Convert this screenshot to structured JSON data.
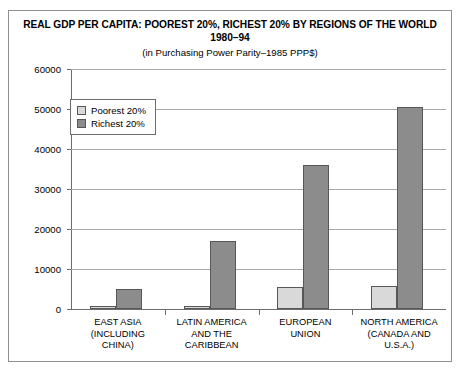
{
  "chart_data": {
    "type": "bar",
    "title": "REAL GDP PER CAPITA: POOREST 20%, RICHEST 20% BY REGIONS OF THE WORLD 1980–94",
    "subtitle": "(in Purchasing Power Parity–1985 PPP$)",
    "xlabel": "",
    "ylabel": "",
    "ylim": [
      0,
      60000
    ],
    "yticks": [
      0,
      10000,
      20000,
      30000,
      40000,
      50000,
      60000
    ],
    "ytick_labels": [
      "0",
      "10000",
      "20000",
      "30000",
      "40000",
      "50000",
      "60000"
    ],
    "grid": true,
    "legend_position": "upper-left-inside",
    "categories": [
      "EAST ASIA\n(INCLUDING\nCHINA)",
      "LATIN AMERICA\nAND THE\nCARIBBEAN",
      "EUROPEAN\nUNION",
      "NORTH AMERICA\n(CANADA AND U.S.A.)"
    ],
    "series": [
      {
        "name": "Poorest 20%",
        "color": "#d9d9d9",
        "values": [
          700,
          800,
          5600,
          5800
        ]
      },
      {
        "name": "Richest 20%",
        "color": "#8c8c8c",
        "values": [
          5100,
          17000,
          36000,
          50500
        ]
      }
    ]
  },
  "colors": {
    "poorest": "#d9d9d9",
    "richest": "#8c8c8c",
    "bar_border": "#575757",
    "gridline": "#a9a9a9",
    "axis": "#6d6d6d",
    "frame": "#8e8e8e",
    "text": "#000000",
    "background": "#ffffff"
  }
}
